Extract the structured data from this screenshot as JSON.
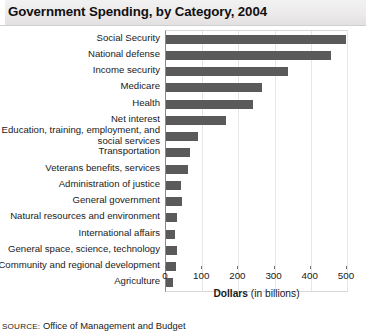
{
  "title": "Government Spending, by Category, 2004",
  "source": {
    "prefix": "SOURCE:",
    "text": " Office of Management and Budget"
  },
  "axis_title": {
    "bold": "Dollars",
    "normal": " (in billions)"
  },
  "colors": {
    "bar": "#5a5a5a",
    "gridline": "#e6e6e6",
    "axis": "#8a8a8a",
    "title_band": "#eceaea"
  },
  "chart_data": {
    "type": "bar",
    "orientation": "horizontal",
    "title": "Government Spending, by Category, 2004",
    "xlabel": "Dollars (in billions)",
    "ylabel": "",
    "xlim": [
      0,
      500
    ],
    "xticks": [
      0,
      100,
      200,
      300,
      400,
      500
    ],
    "grid": true,
    "legend": false,
    "categories": [
      "Social Security",
      "National defense",
      "Income security",
      "Medicare",
      "Health",
      "Net interest",
      "Education, training, employment, and social services",
      "Transportation",
      "Veterans benefits, services",
      "Administration of justice",
      "General government",
      "Natural resources and environment",
      "International affairs",
      "General space, science, technology",
      "Community and regional development",
      "Agriculture"
    ],
    "values": [
      496,
      455,
      337,
      265,
      240,
      165,
      88,
      65,
      60,
      42,
      45,
      31,
      26,
      30,
      28,
      20
    ],
    "units": "billions of dollars"
  }
}
